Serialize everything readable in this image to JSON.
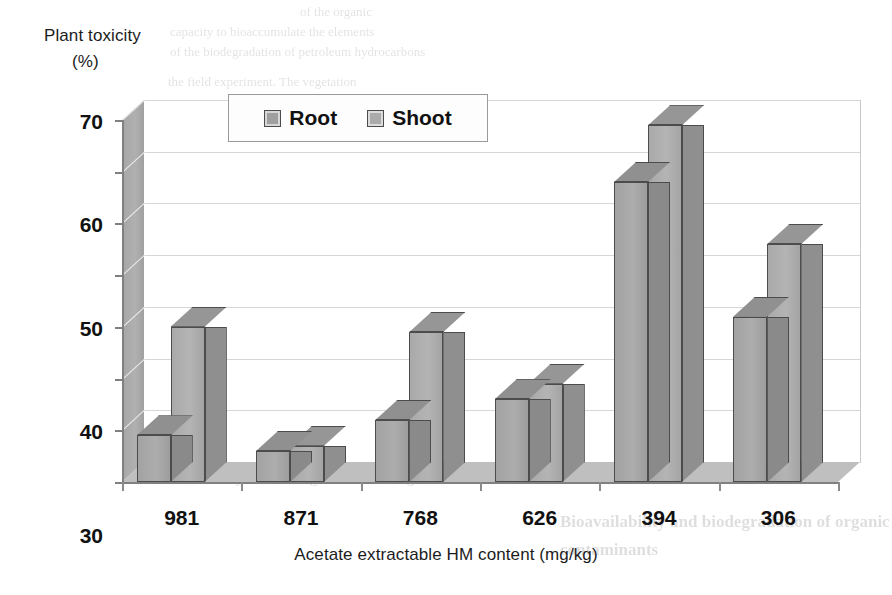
{
  "chart_data": {
    "type": "bar",
    "title": "",
    "ylabel_line1": "Plant toxicity",
    "ylabel_line2": "(%)",
    "xlabel": "Acetate extractable HM content (mg/kg)",
    "categories": [
      "981",
      "871",
      "768",
      "626",
      "394",
      "306"
    ],
    "series": [
      {
        "name": "Root",
        "values": [
          9,
          6,
          12,
          16,
          58,
          32
        ]
      },
      {
        "name": "Shoot",
        "values": [
          30,
          7,
          29,
          19,
          69,
          46
        ]
      }
    ],
    "yticks": [
      0,
      10,
      20,
      30,
      40,
      50,
      60,
      70
    ],
    "ylim": [
      0,
      70
    ],
    "grid": true,
    "legend_position": "top-center",
    "style": "3d-clustered-column",
    "colors": {
      "root": "#a5a5a5",
      "shoot": "#b0b0b0",
      "bar_outline": "#4c4c4c",
      "gridline": "#d7d7d7",
      "axis": "#808080",
      "wall": "#ffffff",
      "floor": "#bfbfbf",
      "sidewall": "#a8a8a8",
      "text": "#111111",
      "legend_border": "#9a9a9a"
    }
  },
  "legend": {
    "items": [
      {
        "label": "Root",
        "swatch": "legend-swatch-root"
      },
      {
        "label": "Shoot",
        "swatch": "legend-swatch-shoot"
      }
    ]
  },
  "background_bleed": {
    "lines": [
      "of the organic",
      "capacity to bioaccumulate the elements",
      "of the biodegradation of petroleum hydrocarbons",
      "the field experiment. The vegetation",
      "samples were collected, the growth rate, biomass,",
      "the accumulation of heavy metals in root and shoot",
      "was assessed during the test period. Bioaccumulated soil",
      "samples were compared with the control values.",
      "In total, 24 soil samples were collected from the site",
      "and analysed for heavy metal and hydrocarbon content.",
      "Statistically significant increases in plant biomass were",
      "observed in all treated plots in comparison with control.",
      "Bioavailability and biodegradation of organic",
      "contaminants"
    ]
  }
}
